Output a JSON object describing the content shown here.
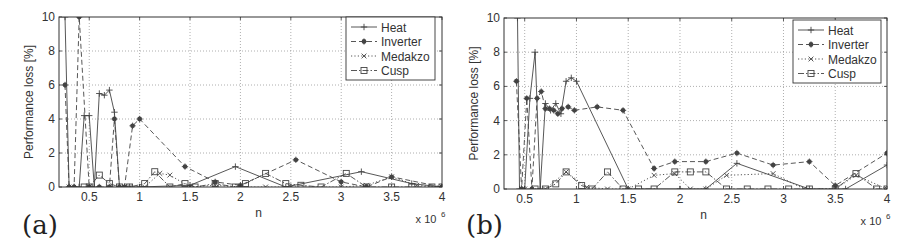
{
  "chart_data": [
    {
      "panel_label": "(a)",
      "type": "line",
      "title": "",
      "xlabel": "n",
      "ylabel": "Performance loss [%]",
      "x_multiplier": "x 10^6",
      "x_multiplier_base": "x 10",
      "x_multiplier_exp": "6",
      "xlim": [
        0.2,
        4.0
      ],
      "ylim": [
        0,
        10
      ],
      "xticks": [
        0.5,
        1,
        1.5,
        2,
        2.5,
        3,
        3.5,
        4
      ],
      "xtick_labels": [
        "0.5",
        "1",
        "1.5",
        "2",
        "2.5",
        "3",
        "3.5",
        "4"
      ],
      "yticks": [
        0,
        2,
        4,
        6,
        8,
        10
      ],
      "ytick_labels": [
        "0",
        "2",
        "4",
        "6",
        "8",
        "10"
      ],
      "grid": true,
      "legend_position": "upper right",
      "series": [
        {
          "name": "Heat",
          "marker": "+",
          "linestyle": "solid",
          "x": [
            0.26,
            0.3,
            0.35,
            0.4,
            0.45,
            0.5,
            0.55,
            0.6,
            0.65,
            0.7,
            0.75,
            0.8,
            0.85,
            0.9,
            1.0,
            1.5,
            1.95,
            2.45,
            3.2,
            3.7,
            4.0
          ],
          "y": [
            10.0,
            0.0,
            0.0,
            0.0,
            4.2,
            4.2,
            0.0,
            5.5,
            5.4,
            5.7,
            4.4,
            0.0,
            0.0,
            0.0,
            0.0,
            0.1,
            1.2,
            0.0,
            0.9,
            0.2,
            0.0
          ]
        },
        {
          "name": "Inverter",
          "marker": "*",
          "linestyle": "dashed",
          "x": [
            0.26,
            0.3,
            0.35,
            0.4,
            0.5,
            0.6,
            0.7,
            0.75,
            0.8,
            0.85,
            0.93,
            1.0,
            1.45,
            1.75,
            2.0,
            2.55,
            3.0,
            3.25,
            3.5,
            4.0
          ],
          "y": [
            6.0,
            0.0,
            0.0,
            10.0,
            0.0,
            0.0,
            0.0,
            4.0,
            0.0,
            0.0,
            3.6,
            4.0,
            1.2,
            0.3,
            0.1,
            1.6,
            0.3,
            0.0,
            0.6,
            0.0
          ]
        },
        {
          "name": "Medakzo",
          "marker": "x",
          "linestyle": "dotted",
          "x": [
            0.3,
            0.5,
            0.7,
            0.9,
            1.05,
            1.2,
            1.3,
            1.5,
            1.75,
            2.0,
            2.25,
            2.5,
            3.0,
            3.25,
            3.5,
            3.75,
            4.0
          ],
          "y": [
            0.0,
            0.0,
            0.0,
            0.0,
            0.0,
            0.8,
            0.7,
            0.0,
            0.1,
            0.0,
            0.0,
            0.0,
            0.0,
            0.1,
            0.6,
            0.1,
            0.0
          ]
        },
        {
          "name": "Cusp",
          "marker": "square",
          "linestyle": "dashdot",
          "x": [
            0.45,
            0.5,
            0.6,
            0.7,
            0.8,
            0.9,
            1.05,
            1.15,
            1.3,
            1.45,
            1.55,
            1.75,
            1.95,
            2.05,
            2.25,
            2.45,
            2.6,
            2.8,
            3.05,
            3.25,
            3.5,
            3.7,
            3.9,
            4.0
          ],
          "y": [
            0.0,
            0.0,
            0.7,
            0.2,
            0.0,
            0.0,
            0.2,
            0.9,
            0.0,
            0.2,
            0.0,
            0.2,
            0.0,
            0.2,
            0.8,
            0.2,
            0.1,
            0.0,
            0.8,
            0.0,
            0.0,
            0.0,
            0.0,
            0.0
          ]
        }
      ]
    },
    {
      "panel_label": "(b)",
      "type": "line",
      "title": "",
      "xlabel": "n",
      "ylabel": "Performance loss [%]",
      "x_multiplier": "x 10^6",
      "x_multiplier_base": "x 10",
      "x_multiplier_exp": "6",
      "xlim": [
        0.3,
        4.0
      ],
      "ylim": [
        0,
        10
      ],
      "xticks": [
        0.5,
        1,
        1.5,
        2,
        2.5,
        3,
        3.5,
        4
      ],
      "xtick_labels": [
        "0.5",
        "1",
        "1.5",
        "2",
        "2.5",
        "3",
        "3.5",
        "4"
      ],
      "yticks": [
        0,
        2,
        4,
        6,
        8,
        10
      ],
      "ytick_labels": [
        "0",
        "2",
        "4",
        "6",
        "8",
        "10"
      ],
      "grid": true,
      "legend_position": "upper right",
      "series": [
        {
          "name": "Heat",
          "marker": "+",
          "linestyle": "solid",
          "x": [
            0.43,
            0.45,
            0.5,
            0.55,
            0.6,
            0.65,
            0.7,
            0.75,
            0.8,
            0.85,
            0.9,
            0.95,
            1.0,
            1.5,
            2.0,
            2.25,
            2.55,
            3.25,
            3.6,
            4.0
          ],
          "y": [
            10.0,
            0.0,
            0.0,
            5.3,
            8.0,
            0.0,
            5.0,
            4.6,
            5.0,
            4.4,
            6.3,
            6.5,
            6.3,
            0.0,
            0.0,
            0.0,
            1.5,
            0.0,
            0.0,
            1.4
          ]
        },
        {
          "name": "Inverter",
          "marker": "*",
          "linestyle": "dashed",
          "x": [
            0.42,
            0.47,
            0.52,
            0.57,
            0.62,
            0.66,
            0.7,
            0.74,
            0.78,
            0.82,
            0.86,
            0.92,
            0.98,
            1.2,
            1.45,
            1.75,
            1.95,
            2.25,
            2.55,
            2.9,
            3.25,
            3.5,
            4.0
          ],
          "y": [
            6.3,
            0.0,
            5.3,
            0.0,
            5.3,
            5.7,
            4.7,
            4.7,
            4.6,
            4.4,
            4.7,
            4.8,
            4.6,
            4.8,
            4.6,
            1.2,
            1.6,
            1.6,
            2.1,
            1.4,
            1.6,
            0.2,
            2.1
          ]
        },
        {
          "name": "Medakzo",
          "marker": "x",
          "linestyle": "dotted",
          "x": [
            0.5,
            0.7,
            0.9,
            1.1,
            1.3,
            1.5,
            1.75,
            1.95,
            2.1,
            2.25,
            2.45,
            2.9,
            3.2,
            3.5,
            3.7,
            4.0
          ],
          "y": [
            0.0,
            0.0,
            1.0,
            0.1,
            0.0,
            0.0,
            0.8,
            0.9,
            0.0,
            0.0,
            0.8,
            0.9,
            0.0,
            0.0,
            0.8,
            0.0
          ]
        },
        {
          "name": "Cusp",
          "marker": "square",
          "linestyle": "dashdot",
          "x": [
            0.6,
            0.7,
            0.8,
            0.9,
            1.05,
            1.15,
            1.3,
            1.45,
            1.6,
            1.75,
            1.95,
            2.1,
            2.25,
            2.45,
            2.65,
            2.85,
            3.05,
            3.25,
            3.5,
            3.7,
            3.9,
            4.0
          ],
          "y": [
            0.0,
            0.0,
            0.3,
            1.0,
            0.2,
            0.0,
            1.0,
            0.0,
            0.0,
            0.0,
            1.0,
            1.0,
            1.0,
            0.0,
            0.0,
            0.0,
            0.0,
            0.0,
            0.0,
            0.9,
            0.0,
            0.0
          ]
        }
      ]
    }
  ],
  "panels": [
    {
      "label": "(a)",
      "plot_box": {
        "left": 59,
        "top": 17,
        "right": 442,
        "bottom": 187
      },
      "legend_box": {
        "left": 346,
        "top": 17,
        "width": 89,
        "height": 63
      }
    },
    {
      "label": "(b)",
      "plot_box": {
        "left": 48,
        "top": 18,
        "right": 431,
        "bottom": 189
      },
      "legend_box": {
        "left": 337,
        "top": 20,
        "width": 88,
        "height": 63
      }
    }
  ],
  "colors": {
    "axis": "#333333",
    "grid": "#9a9a9a",
    "series": "#444444",
    "text": "#333333"
  }
}
